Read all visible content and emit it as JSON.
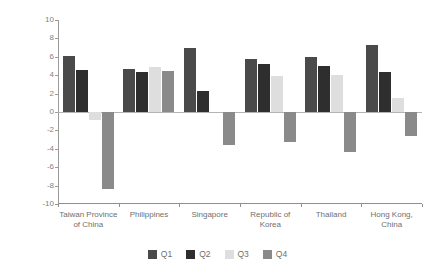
{
  "chart_data": {
    "type": "bar",
    "title": "",
    "subtitle": "",
    "xlabel": "",
    "ylabel": "Per cent (y-o-y)",
    "ylim": [
      -10,
      10
    ],
    "ytick_step": 2,
    "yticks": [
      "10",
      "8",
      "6",
      "4",
      "2",
      "0",
      "-2",
      "-4",
      "-6",
      "-8",
      "-10"
    ],
    "grid": false,
    "legend_position": "bottom",
    "categories": [
      "Taiwan Province\nof China",
      "Philippines",
      "Singapore",
      "Republic of\nKorea",
      "Thailand",
      "Hong Kong,\nChina"
    ],
    "series": [
      {
        "name": "Q1",
        "color": "#4a4a4a",
        "values": [
          6.1,
          4.7,
          7.0,
          5.8,
          6.0,
          7.3
        ]
      },
      {
        "name": "Q2",
        "color": "#2e2e2e",
        "values": [
          4.6,
          4.4,
          2.3,
          5.2,
          5.0,
          4.3
        ]
      },
      {
        "name": "Q3",
        "color": "#dedede",
        "values": [
          -0.9,
          4.9,
          0.0,
          3.9,
          4.0,
          1.5
        ]
      },
      {
        "name": "Q4",
        "color": "#8a8a8a",
        "values": [
          -8.4,
          4.5,
          -3.6,
          -3.3,
          -4.4,
          -2.6
        ]
      }
    ]
  },
  "legend": {
    "entries": [
      {
        "label": "Q1"
      },
      {
        "label": "Q2"
      },
      {
        "label": "Q3"
      },
      {
        "label": "Q4"
      }
    ]
  }
}
